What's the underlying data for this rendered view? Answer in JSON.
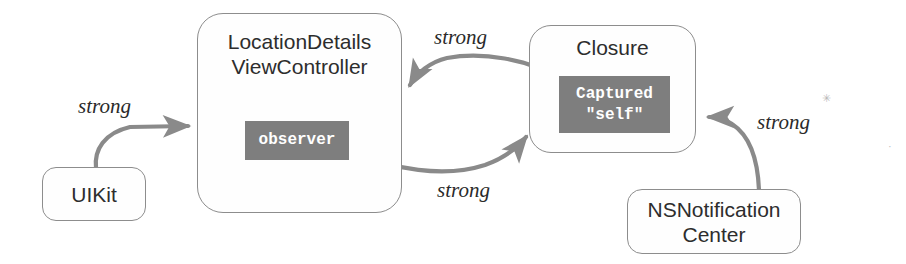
{
  "diagram": {
    "background_color": "#ffffff",
    "stroke_color": "#8d8d8d",
    "arrow_color": "#8a8a8a",
    "badge_color": "#7e7e7e",
    "text_color": "#2d2d2d",
    "nodes": [
      {
        "id": "uikit",
        "label": "UIKit"
      },
      {
        "id": "vc",
        "label": "LocationDetails\nViewController"
      },
      {
        "id": "closure",
        "label": "Closure"
      },
      {
        "id": "nsnc",
        "label": "NSNotification\nCenter"
      }
    ],
    "badges": [
      {
        "id": "observer",
        "label": "observer",
        "parent": "vc"
      },
      {
        "id": "captured",
        "label": "Captured\n\"self\"",
        "parent": "closure"
      }
    ],
    "edges": [
      {
        "id": "uikit-vc",
        "from": "uikit",
        "to": "vc",
        "label": "strong"
      },
      {
        "id": "closure-vc",
        "from": "closure",
        "to": "vc",
        "label": "strong"
      },
      {
        "id": "vc-closure",
        "from": "observer",
        "to": "closure",
        "label": "strong"
      },
      {
        "id": "nsnc-closure",
        "from": "nsnc",
        "to": "closure",
        "label": "strong"
      }
    ]
  }
}
